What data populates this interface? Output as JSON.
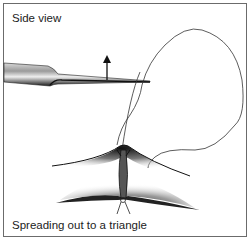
{
  "figure": {
    "top_caption": "Side view",
    "bottom_caption": "Spreading out to a triangle",
    "colors": {
      "border": "#6b6b6b",
      "ink": "#222222",
      "tissue_dark": "#1a1a1a",
      "background": "#ffffff"
    },
    "elements": {
      "forceps": "forceps-tip",
      "arrow": "up-arrow",
      "suture": "suture-loop",
      "tissue": "wound-edges",
      "knot": "suture-knot"
    }
  }
}
